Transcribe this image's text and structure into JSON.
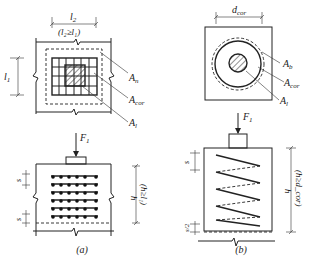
{
  "figure_a": {
    "caption": "(a)",
    "plan": {
      "dim_top": "l",
      "dim_top_sub": "2",
      "dim_top_note": "(l₂≥l₁)",
      "dim_left": "l",
      "dim_left_sub": "1",
      "labels": [
        {
          "main": "A",
          "sub": "n"
        },
        {
          "main": "A",
          "sub": "cor"
        },
        {
          "main": "A",
          "sub": "l"
        }
      ]
    },
    "elevation": {
      "force": "F",
      "force_sub": "1",
      "spacing_top": "s",
      "spacing_bottom": "s",
      "height": "h",
      "height_note": "(h≥l₁)",
      "mesh_rows": 6,
      "mesh_cols": 6
    }
  },
  "figure_b": {
    "caption": "(b)",
    "plan": {
      "dim_top": "d",
      "dim_top_sub": "cor",
      "labels": [
        {
          "main": "A",
          "sub": "b"
        },
        {
          "main": "A",
          "sub": "cor"
        },
        {
          "main": "A",
          "sub": "l"
        }
      ]
    },
    "elevation": {
      "force": "F",
      "force_sub": "1",
      "spacing": "s",
      "half_spacing": "s/2",
      "height": "h",
      "height_note": "(h≥d_cor)"
    }
  }
}
